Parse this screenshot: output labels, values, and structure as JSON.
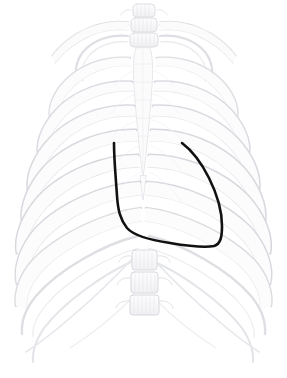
{
  "figure": {
    "background_color": "#ffffff",
    "width": 287,
    "height": 378,
    "caption": ""
  },
  "skeleton": {
    "name": "thoracic-rib-cage",
    "view": "anterior",
    "render_style": "faint pencil line drawing",
    "stroke_color": "#dcdce0",
    "stroke_color_light": "#ecedef",
    "stroke_color_dark": "#cbccd1",
    "fill_color": "#fbfbfc",
    "parts": [
      {
        "name": "cervical-vertebrae",
        "label": "cervical vertebrae"
      },
      {
        "name": "clavicle-left",
        "label": "left clavicle"
      },
      {
        "name": "clavicle-right",
        "label": "right clavicle"
      },
      {
        "name": "sternum",
        "label": "sternum"
      },
      {
        "name": "rib-pairs",
        "label": "ribs 1-10",
        "count": 10
      },
      {
        "name": "costal-margin",
        "label": "costal margin"
      },
      {
        "name": "lumbar-vertebrae",
        "label": "lumbar vertebrae"
      },
      {
        "name": "xiphoid-process",
        "label": "xiphoid process"
      }
    ]
  },
  "annotation": {
    "name": "cardiac-border-outline",
    "label": "cardiac border outline",
    "stroke_color": "#111111",
    "stroke_width": 2.6,
    "line_cap": "round",
    "closed": false,
    "path": "M114,143 C114,160 116,180 117,196 C118,210 120,219 127,228 C134,236 150,240 170,243 C188,246 205,248 214,246 C221,244 222,236 222,226 C222,212 218,196 209,178 C200,160 190,149 182,143",
    "endpoints": [
      {
        "name": "left-superior-endpoint",
        "x": 114,
        "y": 143
      },
      {
        "name": "right-superior-endpoint",
        "x": 182,
        "y": 143
      }
    ],
    "extent": {
      "x_min": 114,
      "x_max": 222,
      "y_min": 143,
      "y_max": 248
    }
  }
}
